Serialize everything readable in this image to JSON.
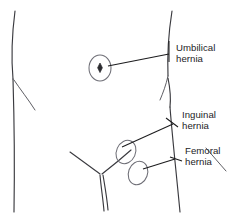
{
  "diagram": {
    "background_color": "#ffffff",
    "outline_color": "#3a3a3f",
    "label_color": "#232326",
    "site_marker_color": "#6e6e76",
    "leader_color": "#1c1c1e"
  },
  "labels": {
    "umbilical": {
      "line1": "Umbilical",
      "line2": "hernia"
    },
    "inguinal": {
      "line1": "Inguinal",
      "line2": "hernia"
    },
    "femoral": {
      "line1": "Femoral",
      "line2": "hernia"
    }
  },
  "markers": {
    "umbilical_site": "umbilicus-ellipse",
    "inguinal_site": "inguinal-ellipse",
    "femoral_site": "femoral-ellipse"
  }
}
